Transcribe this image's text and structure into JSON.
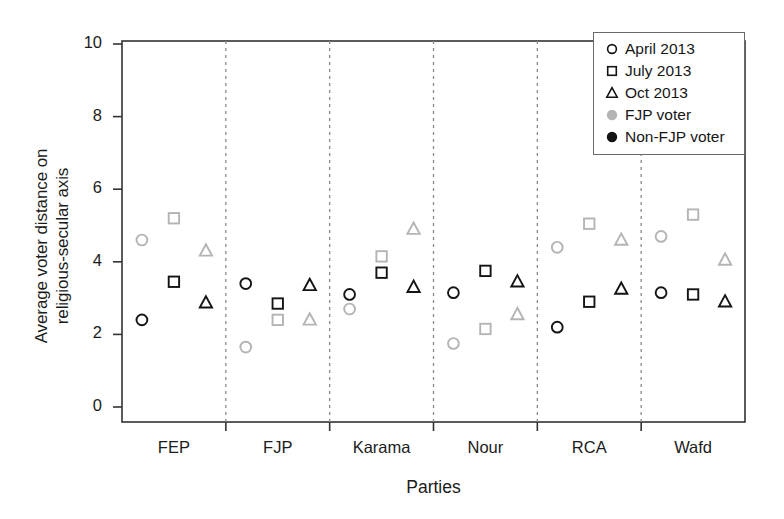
{
  "chart_data": {
    "type": "scatter",
    "title": "",
    "xlabel": "Parties",
    "ylabel": "Average voter distance on religious-secular axis",
    "ylabel_line1": "Average voter distance on",
    "ylabel_line2": "religious-secular axis",
    "ylim": [
      0,
      10
    ],
    "yticks": [
      0,
      2,
      4,
      6,
      8,
      10
    ],
    "grid": false,
    "legend_position": "top-right",
    "categories": [
      "FEP",
      "FJP",
      "Karama",
      "Nour",
      "RCA",
      "Wafd"
    ],
    "legend": [
      {
        "label": "April 2013",
        "marker": "circle",
        "fill": "open"
      },
      {
        "label": "July 2013",
        "marker": "square",
        "fill": "open"
      },
      {
        "label": "Oct 2013",
        "marker": "triangle",
        "fill": "open"
      },
      {
        "label": "FJP voter",
        "marker": "circle",
        "fill": "solid",
        "color": "#b4b4b4"
      },
      {
        "label": "Non-FJP voter",
        "marker": "circle",
        "fill": "solid",
        "color": "#141414"
      }
    ],
    "colors": {
      "fjp_voter": "#b4b4b4",
      "non_fjp_voter": "#141414",
      "axis": "#333333",
      "divider": "#8a8a8a"
    },
    "series": [
      {
        "name": "FJP voter",
        "color": "#b4b4b4",
        "points": [
          {
            "category": "FEP",
            "wave": "April 2013",
            "marker": "circle",
            "value": 4.6
          },
          {
            "category": "FEP",
            "wave": "July 2013",
            "marker": "square",
            "value": 5.2
          },
          {
            "category": "FEP",
            "wave": "Oct 2013",
            "marker": "triangle",
            "value": 4.3
          },
          {
            "category": "FJP",
            "wave": "April 2013",
            "marker": "circle",
            "value": 1.65
          },
          {
            "category": "FJP",
            "wave": "July 2013",
            "marker": "square",
            "value": 2.4
          },
          {
            "category": "FJP",
            "wave": "Oct 2013",
            "marker": "triangle",
            "value": 2.4
          },
          {
            "category": "Karama",
            "wave": "April 2013",
            "marker": "circle",
            "value": 2.7
          },
          {
            "category": "Karama",
            "wave": "July 2013",
            "marker": "square",
            "value": 4.15
          },
          {
            "category": "Karama",
            "wave": "Oct 2013",
            "marker": "triangle",
            "value": 4.9
          },
          {
            "category": "Nour",
            "wave": "April 2013",
            "marker": "circle",
            "value": 1.75
          },
          {
            "category": "Nour",
            "wave": "July 2013",
            "marker": "square",
            "value": 2.15
          },
          {
            "category": "Nour",
            "wave": "Oct 2013",
            "marker": "triangle",
            "value": 2.55
          },
          {
            "category": "RCA",
            "wave": "April 2013",
            "marker": "circle",
            "value": 4.4
          },
          {
            "category": "RCA",
            "wave": "July 2013",
            "marker": "square",
            "value": 5.05
          },
          {
            "category": "RCA",
            "wave": "Oct 2013",
            "marker": "triangle",
            "value": 4.6
          },
          {
            "category": "Wafd",
            "wave": "April 2013",
            "marker": "circle",
            "value": 4.7
          },
          {
            "category": "Wafd",
            "wave": "July 2013",
            "marker": "square",
            "value": 5.3
          },
          {
            "category": "Wafd",
            "wave": "Oct 2013",
            "marker": "triangle",
            "value": 4.05
          }
        ]
      },
      {
        "name": "Non-FJP voter",
        "color": "#141414",
        "points": [
          {
            "category": "FEP",
            "wave": "April 2013",
            "marker": "circle",
            "value": 2.4
          },
          {
            "category": "FEP",
            "wave": "July 2013",
            "marker": "square",
            "value": 3.45
          },
          {
            "category": "FEP",
            "wave": "Oct 2013",
            "marker": "triangle",
            "value": 2.87
          },
          {
            "category": "FJP",
            "wave": "April 2013",
            "marker": "circle",
            "value": 3.4
          },
          {
            "category": "FJP",
            "wave": "July 2013",
            "marker": "square",
            "value": 2.85
          },
          {
            "category": "FJP",
            "wave": "Oct 2013",
            "marker": "triangle",
            "value": 3.35
          },
          {
            "category": "Karama",
            "wave": "April 2013",
            "marker": "circle",
            "value": 3.1
          },
          {
            "category": "Karama",
            "wave": "July 2013",
            "marker": "square",
            "value": 3.7
          },
          {
            "category": "Karama",
            "wave": "Oct 2013",
            "marker": "triangle",
            "value": 3.3
          },
          {
            "category": "Nour",
            "wave": "April 2013",
            "marker": "circle",
            "value": 3.15
          },
          {
            "category": "Nour",
            "wave": "July 2013",
            "marker": "square",
            "value": 3.75
          },
          {
            "category": "Nour",
            "wave": "Oct 2013",
            "marker": "triangle",
            "value": 3.45
          },
          {
            "category": "RCA",
            "wave": "April 2013",
            "marker": "circle",
            "value": 2.2
          },
          {
            "category": "RCA",
            "wave": "July 2013",
            "marker": "square",
            "value": 2.9
          },
          {
            "category": "RCA",
            "wave": "Oct 2013",
            "marker": "triangle",
            "value": 3.25
          },
          {
            "category": "Wafd",
            "wave": "April 2013",
            "marker": "circle",
            "value": 3.15
          },
          {
            "category": "Wafd",
            "wave": "July 2013",
            "marker": "square",
            "value": 3.1
          },
          {
            "category": "Wafd",
            "wave": "Oct 2013",
            "marker": "triangle",
            "value": 2.9
          }
        ]
      }
    ]
  }
}
